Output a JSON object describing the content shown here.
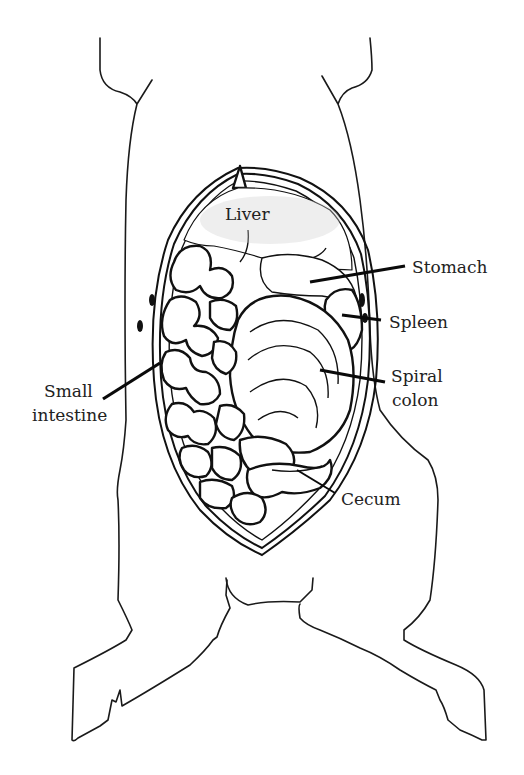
{
  "figure": {
    "labels": {
      "liver": "Liver",
      "stomach": "Stomach",
      "spleen": "Spleen",
      "spiral_colon_line1": "Spiral",
      "spiral_colon_line2": "colon",
      "small_intestine_line1": "Small",
      "small_intestine_line2": "intestine",
      "cecum": "Cecum"
    },
    "colors": {
      "line": "#111111",
      "text": "#222222",
      "background": "#ffffff"
    }
  }
}
